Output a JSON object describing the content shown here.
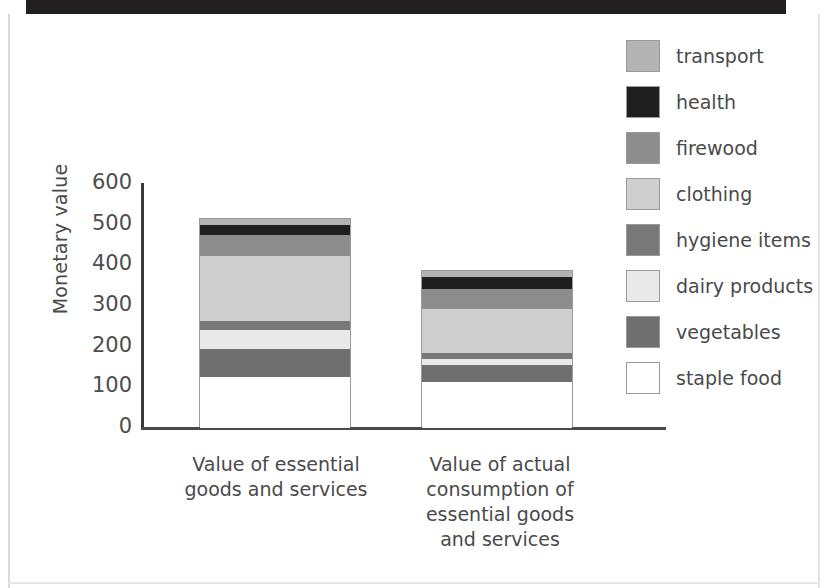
{
  "chart_data": {
    "type": "bar",
    "subtype": "stacked-vertical",
    "title": "",
    "xlabel": "",
    "ylabel": "Monetary value",
    "ylim": [
      0,
      600
    ],
    "yticks": [
      600,
      500,
      400,
      300,
      200,
      100,
      0
    ],
    "grid": false,
    "legend_position": "right",
    "legend_order_top_to_bottom": [
      "transport",
      "health",
      "firewood",
      "clothing",
      "hygiene items",
      "dairy products",
      "vegetables",
      "staple food"
    ],
    "categories": [
      "Value of essential goods and services",
      "Value of actual consumption of essential goods and services"
    ],
    "series": [
      {
        "name": "staple food",
        "color": "#ffffff",
        "values": [
          125,
          113
        ]
      },
      {
        "name": "vegetables",
        "color": "#6f6f6f",
        "values": [
          69,
          42
        ]
      },
      {
        "name": "dairy products",
        "color": "#e9e9e9",
        "values": [
          47,
          15
        ]
      },
      {
        "name": "hygiene items",
        "color": "#787878",
        "values": [
          22,
          15
        ]
      },
      {
        "name": "clothing",
        "color": "#cfcfcf",
        "values": [
          160,
          108
        ]
      },
      {
        "name": "firewood",
        "color": "#8d8d8d",
        "values": [
          52,
          49
        ]
      },
      {
        "name": "health",
        "color": "#1f1f1f",
        "values": [
          25,
          30
        ]
      },
      {
        "name": "transport",
        "color": "#b3b3b3",
        "values": [
          15,
          15
        ]
      }
    ],
    "totals": [
      515,
      387
    ]
  },
  "axis": {
    "y_title": "Monetary value",
    "ticks": [
      {
        "value": "600"
      },
      {
        "value": "500"
      },
      {
        "value": "400"
      },
      {
        "value": "300"
      },
      {
        "value": "200"
      },
      {
        "value": "100"
      },
      {
        "value": "0"
      }
    ]
  },
  "xlabels": [
    {
      "text": "Value of essential\ngoods and services"
    },
    {
      "text": "Value of actual\nconsumption of\nessential goods\nand services"
    }
  ],
  "legend": {
    "items": [
      {
        "label": "transport",
        "color": "#b3b3b3"
      },
      {
        "label": "health",
        "color": "#1f1f1f"
      },
      {
        "label": "firewood",
        "color": "#8d8d8d"
      },
      {
        "label": "clothing",
        "color": "#cfcfcf"
      },
      {
        "label": "hygiene items",
        "color": "#787878"
      },
      {
        "label": "dairy products",
        "color": "#e9e9e9"
      },
      {
        "label": "vegetables",
        "color": "#6f6f6f"
      },
      {
        "label": "staple food",
        "color": "#ffffff"
      }
    ]
  }
}
